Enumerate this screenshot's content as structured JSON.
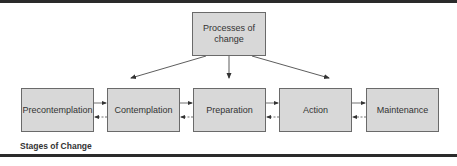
{
  "diagram": {
    "top_node": {
      "label": "Processes of change"
    },
    "stages": [
      {
        "label": "Precontemplation"
      },
      {
        "label": "Contemplation"
      },
      {
        "label": "Preparation"
      },
      {
        "label": "Action"
      },
      {
        "label": "Maintenance"
      }
    ],
    "connections": {
      "from_top_node_to": [
        "Contemplation",
        "Preparation",
        "Action"
      ],
      "between_adjacent_stages": "bidirectional (forward solid, backward dashed)"
    },
    "caption": "Stages of Change"
  },
  "colors": {
    "box_fill": "#d8d8d8",
    "box_border": "#6a6a6a",
    "rule": "#2a2a2a",
    "text": "#333333"
  }
}
